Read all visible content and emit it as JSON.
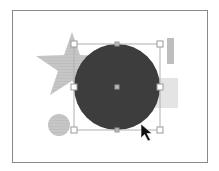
{
  "canvas": {
    "frame": {
      "x": 12,
      "y": 10,
      "width": 196,
      "height": 153
    },
    "shapes": [
      {
        "type": "star",
        "fill": "#c4c4c4",
        "cx": 72,
        "cy": 66,
        "outer_r": 34,
        "inner_r": 14
      },
      {
        "type": "rect",
        "fill": "#bdbdbd",
        "x": 167,
        "y": 38,
        "width": 7,
        "height": 26
      },
      {
        "type": "rect",
        "fill": "#e2e2e2",
        "x": 147,
        "y": 78,
        "width": 31,
        "height": 30
      },
      {
        "type": "circle",
        "fill": "#bdbdbd",
        "cx": 59,
        "cy": 125,
        "r": 11
      },
      {
        "type": "circle",
        "fill": "#3d3d3d",
        "cx": 117,
        "cy": 87,
        "r": 43,
        "selected": true
      }
    ],
    "selection": {
      "x": 74,
      "y": 44,
      "width": 86,
      "height": 86,
      "stroke": "#b0b0b0",
      "handles": [
        "top-left",
        "top-center",
        "top-right",
        "middle-left",
        "center",
        "middle-right",
        "bottom-left",
        "bottom-center",
        "bottom-right"
      ]
    },
    "cursor": {
      "type": "arrow-pointer",
      "x": 141,
      "y": 124
    }
  }
}
